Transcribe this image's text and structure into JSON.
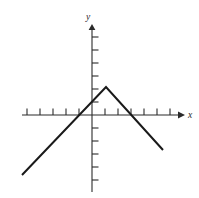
{
  "figure": {
    "width": 199,
    "height": 198,
    "background_color": "#ffffff",
    "axis_color": "#2b2b2b",
    "curve_color": "#1a1a1a"
  },
  "labels": {
    "x_axis": "x",
    "y_axis": "y"
  },
  "chart_data": {
    "type": "line",
    "title": "",
    "xlabel": "x",
    "ylabel": "y",
    "grid": false,
    "legend": false,
    "axis_arrows": [
      "x-positive",
      "y-positive"
    ],
    "origin_px": [
      92,
      115
    ],
    "unit_px": 13,
    "xlim": [
      -5.6,
      6.8
    ],
    "ylim": [
      -6.2,
      6.9
    ],
    "xticks": [
      -5,
      -4,
      -3,
      -2,
      -1,
      1,
      2,
      3,
      4,
      5,
      6
    ],
    "yticks": [
      -5,
      -4,
      -3,
      -2,
      -1,
      1,
      2,
      3,
      4,
      5,
      6
    ],
    "xtick_labels": [],
    "ytick_labels": [],
    "series": [
      {
        "name": "piecewise-linear-peak",
        "shape": "inverted-v",
        "x": [
          -5.4,
          1.0,
          5.5
        ],
        "y": [
          -4.6,
          2.2,
          -2.7
        ],
        "vertex": [
          1.0,
          2.2
        ],
        "left_slope": 1.06,
        "right_slope": -1.09,
        "x_intercepts": [
          -3.1,
          3.0
        ],
        "points_px": [
          [
            22,
            175
          ],
          [
            106,
            87
          ],
          [
            163,
            150
          ]
        ]
      }
    ]
  }
}
